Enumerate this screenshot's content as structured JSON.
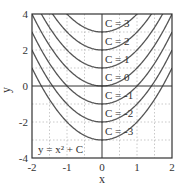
{
  "chart_data": {
    "type": "line",
    "title": "",
    "xlabel": "x",
    "ylabel": "y",
    "xlim": [
      -2,
      2
    ],
    "ylim": [
      -4,
      4
    ],
    "xticks": [
      "-2",
      "-1",
      "0",
      "1",
      "2"
    ],
    "yticks": [
      "-4",
      "-2",
      "0",
      "2",
      "4"
    ],
    "grid": true,
    "annotation": "y = x² + C",
    "equation": "y = x^2 + C",
    "series": [
      {
        "name": "C = 3",
        "C": 3
      },
      {
        "name": "C = 2",
        "C": 2
      },
      {
        "name": "C = 1",
        "C": 1
      },
      {
        "name": "C = 0",
        "C": 0
      },
      {
        "name": "C = -1",
        "C": -1
      },
      {
        "name": "C = -2",
        "C": -2
      },
      {
        "name": "C = -3",
        "C": -3
      }
    ],
    "colors": {
      "curve": "#555555",
      "axis": "#333333",
      "grid": "#bbbbbb"
    }
  }
}
